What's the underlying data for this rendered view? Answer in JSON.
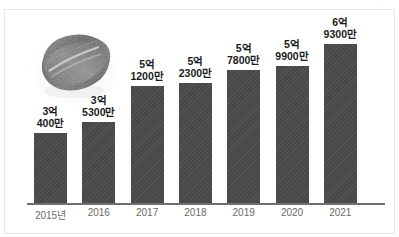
{
  "watermark": "· · · ·",
  "chart_data": {
    "type": "bar",
    "title": "",
    "subtitle": "",
    "xlabel": "",
    "ylabel": "",
    "grid": false,
    "legend": "none",
    "axis_baseline": true,
    "unit_note": "억 / 만 (Korean numerals)",
    "categories": [
      "2015년",
      "2016",
      "2017",
      "2018",
      "2019",
      "2020",
      "2021"
    ],
    "values": [
      304000000,
      353000000,
      512000000,
      523000000,
      578000000,
      599000000,
      693000000
    ],
    "ylim": [
      0,
      750000000
    ],
    "value_labels": [
      {
        "line1": "3억",
        "line2": "400만"
      },
      {
        "line1": "3억",
        "line2": "5300만"
      },
      {
        "line1": "5억",
        "line2": "1200만"
      },
      {
        "line1": "5억",
        "line2": "2300만"
      },
      {
        "line1": "5억",
        "line2": "7800만"
      },
      {
        "line1": "5억",
        "line2": "9900만"
      },
      {
        "line1": "6억",
        "line2": "9300만"
      }
    ],
    "bar_color": "#4b4b4b",
    "label_color": "#1b1b1b",
    "category_color": "#6a6a6a",
    "axis_color": "#6f6f6f"
  },
  "photo": {
    "alt": "dried-seaweed-product-photo"
  }
}
